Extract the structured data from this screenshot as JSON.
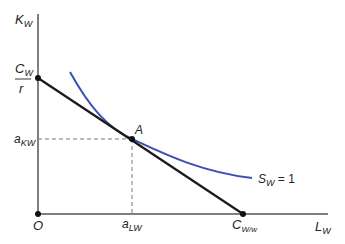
{
  "diagram": {
    "type": "isocost-isoquant",
    "axes": {
      "y_label_main": "K",
      "y_label_sub": "W",
      "x_label_main": "L",
      "x_label_sub": "W",
      "origin_label": "O"
    },
    "points": {
      "y_intercept": {
        "label_num_main": "C",
        "label_num_sub": "W",
        "label_den": "r"
      },
      "x_intercept": {
        "label_main": "C",
        "label_sub": "W/w"
      },
      "tangency": {
        "label": "A"
      }
    },
    "guides": {
      "y_value": {
        "main": "a",
        "sub": "KW"
      },
      "x_value": {
        "main": "a",
        "sub": "LW"
      }
    },
    "curve": {
      "label_main": "S",
      "label_sub": "W",
      "label_rest": " = 1"
    },
    "colors": {
      "axis": "#555555",
      "budget_line": "#1a1a1a",
      "isoquant": "#3a4fb5",
      "guide": "#777777"
    }
  }
}
